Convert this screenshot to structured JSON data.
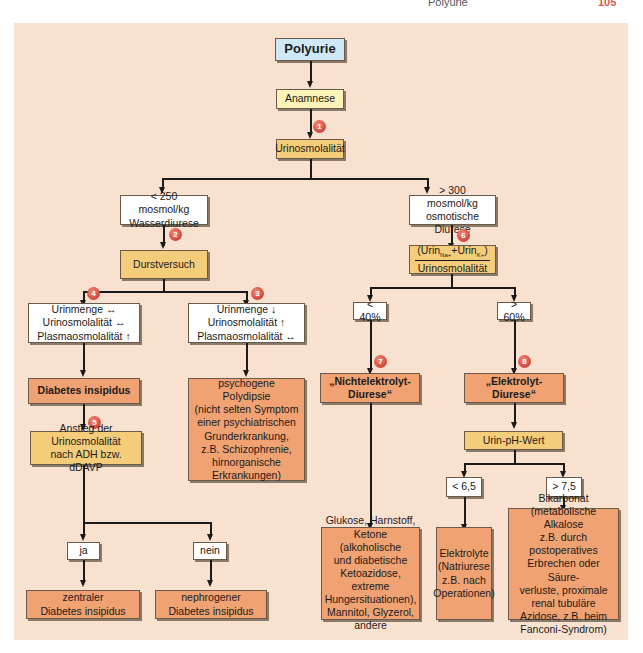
{
  "running_head": {
    "title": "Polyurie",
    "page": "105"
  },
  "diagram": {
    "title": "Polyurie",
    "anamnese": "Anamnese",
    "urinosmolalitaet": "Urinosmolalität",
    "left_branch": {
      "condition_line1": "< 250 mosmol/kg",
      "condition_line2": "Wasserdiurese",
      "test": "Durstversuch",
      "case_a": {
        "line1": "Urinmenge ↔",
        "line2": "Urinosmolalität ↔",
        "line3": "Plasmaosmolalität ↑",
        "result": "Diabetes insipidus",
        "test_line1": "Anstieg der Urinosmolalität",
        "test_line2": "nach ADH bzw. dDAVP",
        "yes": "ja",
        "no": "nein",
        "yes_result_line1": "zentraler",
        "yes_result_line2": "Diabetes insipidus",
        "no_result_line1": "nephrogener",
        "no_result_line2": "Diabetes insipidus"
      },
      "case_b": {
        "line1": "Urinmenge ↓",
        "line2": "Urinosmolalität ↑",
        "line3": "Plasmaosmolalität ↔",
        "result_lines": [
          "psychogene Polydipsie",
          "(nicht selten Symptom",
          "einer psychiatrischen",
          "Grunderkrankung,",
          "z.B. Schizophrenie,",
          "hirnorganische",
          "Erkrankungen)"
        ]
      }
    },
    "right_branch": {
      "condition_line1": "> 300 mosmol/kg",
      "condition_line2": "osmotische Diurese",
      "ratio_numerator_prefix": "(Urin",
      "ratio_na": "Na+",
      "ratio_plus": "+Urin",
      "ratio_k": "K+",
      "ratio_suffix": ")",
      "ratio_denominator": "Urinosmolalität",
      "low": "< 40%",
      "high": "> 60%",
      "non_electrolyte_line1": "„Nichtelektrolyt-",
      "non_electrolyte_line2": "Diurese“",
      "electrolyte": "„Elektrolyt-Diurese“",
      "non_electrolyte_causes": [
        "Glukose, Harnstoff,",
        "Ketone (alkoholische",
        "und diabetische",
        "Ketoazidose, extreme",
        "Hungersituationen),",
        "Mannitol, Glyzerol,",
        "andere"
      ],
      "ph_test": "Urin-pH-Wert",
      "ph_low": "< 6,5",
      "ph_high": "> 7,5",
      "ph_low_result": [
        "Elektrolyte",
        "(Natriurese",
        "z.B. nach",
        "Operationen)"
      ],
      "ph_high_result": [
        "Bikarbonat",
        "(metabolische Alkalose",
        "z.B. durch postoperatives",
        "Erbrechen oder Säure-",
        "verluste, proximale",
        "renal tubuläre",
        "Azidose, z.B. beim",
        "Fanconi-Syndrom)"
      ]
    },
    "badges": [
      "1",
      "2",
      "3",
      "4",
      "5",
      "6",
      "7",
      "8"
    ]
  },
  "colors": {
    "panel_bg": "#f9e1cf",
    "title_box": "#cfe8f5",
    "anamnese_box": "#fbf3b8",
    "decision_box": "#f5cd7a",
    "result_box": "#f0a272",
    "badge": "#d2443a"
  }
}
